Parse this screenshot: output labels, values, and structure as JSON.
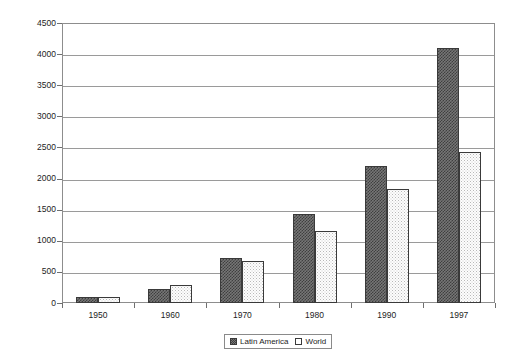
{
  "chart_data": {
    "type": "bar",
    "title": "",
    "subtitle": "",
    "xlabel": "",
    "ylabel": "Index (1950=100)",
    "categories": [
      "1950",
      "1960",
      "1970",
      "1980",
      "1990",
      "1997"
    ],
    "series": [
      {
        "name": "Latin America",
        "values": [
          100,
          225,
          720,
          1430,
          2200,
          4100
        ]
      },
      {
        "name": "World",
        "values": [
          100,
          290,
          670,
          1150,
          1830,
          2430
        ]
      }
    ],
    "ylim": [
      0,
      4500
    ],
    "ytick_values": [
      0,
      500,
      1000,
      1500,
      2000,
      2500,
      3000,
      3500,
      4000,
      4500
    ],
    "ytick_labels": [
      "0",
      "500",
      "1000",
      "1500",
      "2000",
      "2500",
      "3000",
      "3500",
      "4000",
      "4500"
    ],
    "grid": true,
    "grid_axis": "y",
    "legend_position": "bottom-center",
    "legend_entries": [
      "Latin America",
      "World"
    ],
    "colors": {
      "latin_america": "#5a5a5a",
      "world": "#f5f5f5",
      "bar_outline": "#3a3a3a",
      "gridline": "#9a9a9a",
      "axis": "#8d8d8d",
      "text": "#1d1d1d",
      "background": "#ffffff"
    }
  }
}
